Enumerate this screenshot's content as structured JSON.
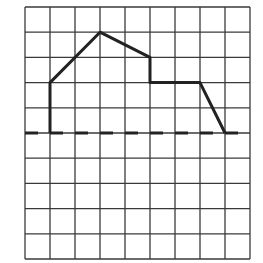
{
  "diagram": {
    "type": "grid-figure",
    "grid": {
      "columns": 9,
      "rows": 10,
      "origin_px": [
        25,
        7
      ],
      "cell_w": 25,
      "cell_h": 25.2,
      "line_color": "#3a3a3a"
    },
    "figure": {
      "description": "Open polyline drawn on square grid above a dashed baseline",
      "points": [
        [
          1,
          5
        ],
        [
          1,
          3
        ],
        [
          3,
          1
        ],
        [
          5,
          2
        ],
        [
          5,
          3
        ],
        [
          7,
          3
        ],
        [
          8,
          5
        ]
      ],
      "stroke_color": "#222222"
    },
    "baseline": {
      "row": 5,
      "from_col": 0,
      "to_col": 8.6,
      "style": "dashed",
      "stroke_color": "#222222"
    }
  }
}
